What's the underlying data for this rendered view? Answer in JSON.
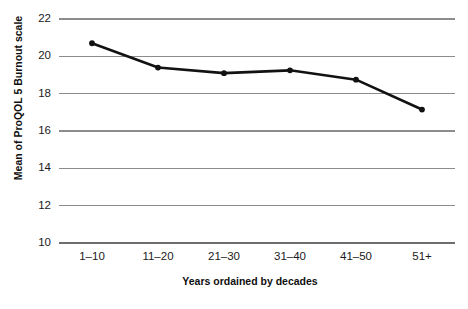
{
  "chart_data": {
    "type": "line",
    "title": "",
    "xlabel": "Years ordained by decades",
    "ylabel": "Mean of ProQOL 5 Burnout scale",
    "categories": [
      "1–10",
      "11–20",
      "21–30",
      "31–40",
      "41–50",
      "51+"
    ],
    "values": [
      20.7,
      19.4,
      19.1,
      19.25,
      18.75,
      17.15
    ],
    "series": [
      {
        "name": "Mean of ProQOL 5 Burnout scale",
        "values": [
          20.7,
          19.4,
          19.1,
          19.25,
          18.75,
          17.15
        ]
      }
    ],
    "ylim": [
      10,
      22
    ],
    "yticks": [
      10,
      12,
      14,
      16,
      18,
      20,
      22
    ],
    "ytick_labels": [
      "10",
      "12",
      "14",
      "16",
      "18",
      "20",
      "22"
    ],
    "grid": "horizontal",
    "legend": "none",
    "line_color": "#121212",
    "grid_color": "#8c8c8c",
    "marker": "circle"
  }
}
